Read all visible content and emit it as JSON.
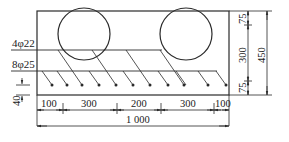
{
  "diagram": {
    "type": "reinforced-concrete-section",
    "colors": {
      "line": "#2a2a2a",
      "background": "#ffffff"
    },
    "labels": {
      "top_bars": "4φ22",
      "bottom_bars": "8φ25"
    },
    "dimensions": {
      "horizontal": [
        "100",
        "300",
        "200",
        "300",
        "100"
      ],
      "overall_width": "1 000",
      "vertical_segments": [
        "75",
        "300",
        "75"
      ],
      "overall_height": "450",
      "cover": "40"
    }
  }
}
